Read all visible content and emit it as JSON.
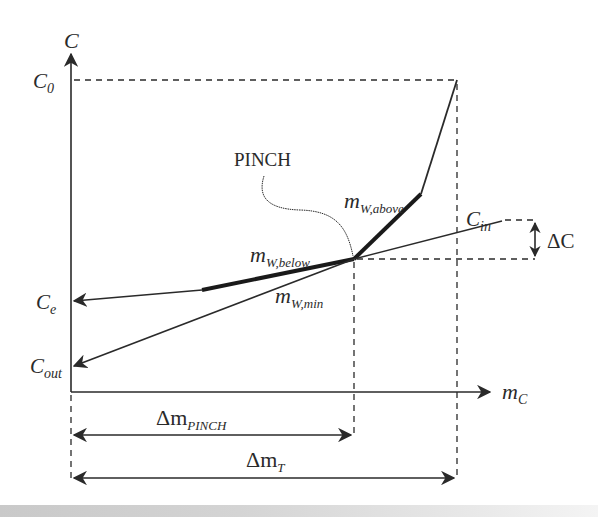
{
  "diagram": {
    "axes": {
      "y_label": "C",
      "x_label_main": "m",
      "x_label_sub": "C"
    },
    "y_levels": [
      {
        "id": "c0",
        "main": "C",
        "sub": "0"
      },
      {
        "id": "ce",
        "main": "C",
        "sub": "e"
      },
      {
        "id": "cout",
        "main": "C",
        "sub": "out"
      },
      {
        "id": "cin",
        "main": "C",
        "sub": "in"
      }
    ],
    "annotations": {
      "pinch": "PINCH",
      "m_w_above": {
        "main": "m",
        "sub": "W,above"
      },
      "m_w_below": {
        "main": "m",
        "sub": "W,below"
      },
      "m_w_min": {
        "main": "m",
        "sub": "W,min"
      },
      "delta_c": "ΔC",
      "delta_m_pinch": {
        "main": "Δm",
        "sub": "PINCH"
      },
      "delta_m_t": {
        "main": "Δm",
        "sub": "T"
      }
    },
    "colors": {
      "line": "#2a2a2a",
      "background": "#ffffff"
    }
  }
}
